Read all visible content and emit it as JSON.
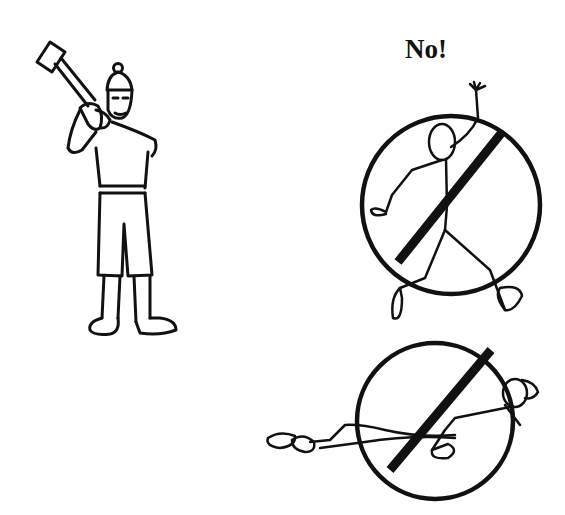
{
  "illustration": {
    "subject": "Safe stance for swinging a sledgehammer vs. unsafe postures",
    "correct_figure": "worker-with-sledgehammer",
    "prohibited_figures": [
      "stick-figure-overreaching",
      "stick-figure-lying-down"
    ]
  },
  "label": {
    "text": "No!"
  },
  "colors": {
    "ink": "#111111",
    "background": "#ffffff"
  }
}
